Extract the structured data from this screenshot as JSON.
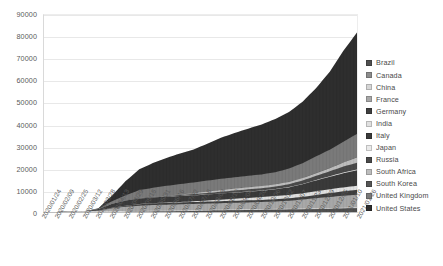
{
  "chart_data": {
    "type": "area",
    "stacked": true,
    "title": "",
    "subtitle": "",
    "xlabel": "",
    "ylabel": "",
    "ylim": [
      0,
      90000
    ],
    "y_ticks": [
      0,
      10000,
      20000,
      30000,
      40000,
      50000,
      60000,
      70000,
      80000,
      90000
    ],
    "grid": true,
    "legend_position": "right",
    "x_tick_interval_days": 16,
    "x_tick_labels": [
      "2020/01/24",
      "2020/02/09",
      "2020/02/25",
      "2020/03/12",
      "2020/03/28",
      "2020/04/13",
      "2020/04/29",
      "2020/05/15",
      "2020/05/31",
      "2020/06/16",
      "2020/07/02",
      "2020/07/18",
      "2020/08/03",
      "2020/08/19",
      "2020/09/04",
      "2020/09/20",
      "2020/10/06",
      "2020/10/22",
      "2020/11/07",
      "2020/11/23",
      "2020/12/09",
      "2020/12/25",
      "2021/01/10",
      "2021/01/26"
    ],
    "categories": [
      "2020/01/24",
      "2020/02/09",
      "2020/02/25",
      "2020/03/12",
      "2020/03/28",
      "2020/04/13",
      "2020/04/29",
      "2020/05/15",
      "2020/05/31",
      "2020/06/16",
      "2020/07/02",
      "2020/07/18",
      "2020/08/03",
      "2020/08/19",
      "2020/09/04",
      "2020/09/20",
      "2020/10/06",
      "2020/10/22",
      "2020/11/07",
      "2020/11/23",
      "2020/12/09",
      "2020/12/25",
      "2021/01/10",
      "2021/01/26"
    ],
    "series": [
      {
        "name": "Brazil",
        "color": "#4f4f4f",
        "values": [
          0,
          0,
          0,
          0,
          30,
          180,
          480,
          900,
          1500,
          2200,
          3100,
          4200,
          5300,
          6400,
          7500,
          8300,
          9000,
          9600,
          10200,
          11000,
          12000,
          13200,
          14600,
          16200
        ]
      },
      {
        "name": "Canada",
        "color": "#8c8c8c",
        "values": [
          0,
          0,
          0,
          0,
          5,
          25,
          60,
          100,
          140,
          170,
          190,
          205,
          215,
          222,
          228,
          234,
          242,
          255,
          275,
          305,
          345,
          395,
          460,
          540
        ]
      },
      {
        "name": "China",
        "color": "#d6d6d6",
        "values": [
          20,
          400,
          2500,
          3180,
          3300,
          3340,
          3350,
          3360,
          3365,
          3370,
          3375,
          3380,
          3385,
          3390,
          3395,
          3400,
          3405,
          3410,
          3415,
          3420,
          3425,
          3430,
          3435,
          3440
        ]
      },
      {
        "name": "France",
        "color": "#a8a8a8",
        "values": [
          0,
          0,
          0,
          40,
          1800,
          12000,
          18500,
          22500,
          24500,
          25500,
          26000,
          26500,
          27000,
          27500,
          28000,
          28800,
          29800,
          31500,
          34000,
          38000,
          43000,
          47000,
          50000,
          52500
        ]
      },
      {
        "name": "Germany",
        "color": "#3f3f3f",
        "values": [
          0,
          0,
          0,
          5,
          300,
          2000,
          4200,
          6300,
          7200,
          7800,
          8100,
          8200,
          8300,
          8400,
          8500,
          8600,
          8800,
          9200,
          10000,
          11500,
          13500,
          16000,
          19000,
          21500
        ]
      },
      {
        "name": "India",
        "color": "#e0e0e0",
        "values": [
          0,
          0,
          0,
          0,
          10,
          60,
          200,
          450,
          800,
          1200,
          1800,
          2800,
          4500,
          6500,
          8500,
          10500,
          12000,
          13500,
          14500,
          15200,
          15800,
          16300,
          16800,
          17300
        ]
      },
      {
        "name": "Italy",
        "color": "#3a3a3a",
        "values": [
          0,
          0,
          0,
          400,
          6800,
          17000,
          21500,
          23500,
          24000,
          24500,
          25000,
          25300,
          25500,
          25800,
          26000,
          26400,
          27000,
          28500,
          32000,
          38000,
          46000,
          53000,
          60000,
          65000
        ]
      },
      {
        "name": "Japan",
        "color": "#eaeaea",
        "values": [
          0,
          0,
          0,
          5,
          40,
          80,
          180,
          300,
          350,
          380,
          400,
          420,
          450,
          550,
          700,
          900,
          1050,
          1200,
          1350,
          1600,
          1950,
          2400,
          3200,
          4100
        ]
      },
      {
        "name": "Russia",
        "color": "#4a4a4a",
        "values": [
          0,
          0,
          0,
          0,
          5,
          60,
          300,
          900,
          1800,
          2800,
          3800,
          4800,
          6000,
          7000,
          8000,
          8800,
          9600,
          10500,
          12000,
          14500,
          17500,
          21000,
          25000,
          28500
        ]
      },
      {
        "name": "South Africa",
        "color": "#bdbdbd",
        "values": [
          0,
          0,
          0,
          0,
          2,
          25,
          75,
          200,
          550,
          1200,
          2400,
          4000,
          6000,
          7500,
          8500,
          9000,
          9400,
          9700,
          9900,
          10200,
          11000,
          13000,
          17000,
          22000
        ]
      },
      {
        "name": "South Korea",
        "color": "#555555",
        "values": [
          0,
          0,
          12,
          70,
          140,
          210,
          245,
          260,
          270,
          280,
          285,
          295,
          300,
          310,
          340,
          380,
          420,
          450,
          480,
          510,
          560,
          640,
          780,
          950
        ]
      },
      {
        "name": "United Kingdom",
        "color": "#7a7a7a",
        "values": [
          0,
          0,
          0,
          10,
          1200,
          11000,
          22000,
          34000,
          38000,
          41500,
          44000,
          45200,
          46200,
          47000,
          47500,
          48000,
          48800,
          51000,
          56000,
          63000,
          71000,
          78000,
          88000,
          99000
        ]
      },
      {
        "name": "United States",
        "color": "#2e2e2e",
        "values": [
          0,
          0,
          0,
          50,
          2500,
          24000,
          60000,
          88000,
          105000,
          118000,
          130000,
          140000,
          156000,
          174000,
          188000,
          200000,
          212000,
          226000,
          240000,
          260000,
          290000,
          330000,
          385000,
          430000
        ]
      }
    ],
    "stack_totals_display": {
      "note": "stacked band top reaches approximately 80000 at the final tick",
      "peak_value": 82000
    },
    "stack_band_tops_pct": [
      {
        "series": "United States",
        "top_pct_of_max": 100
      }
    ]
  },
  "legend": {
    "items": [
      {
        "label": "Brazil",
        "color": "#4f4f4f"
      },
      {
        "label": "Canada",
        "color": "#8c8c8c"
      },
      {
        "label": "China",
        "color": "#d6d6d6"
      },
      {
        "label": "France",
        "color": "#a8a8a8"
      },
      {
        "label": "Germany",
        "color": "#3f3f3f"
      },
      {
        "label": "India",
        "color": "#e0e0e0"
      },
      {
        "label": "Italy",
        "color": "#3a3a3a"
      },
      {
        "label": "Japan",
        "color": "#eaeaea"
      },
      {
        "label": "Russia",
        "color": "#4a4a4a"
      },
      {
        "label": "South Africa",
        "color": "#bdbdbd"
      },
      {
        "label": "South Korea",
        "color": "#555555"
      },
      {
        "label": "United Kingdom",
        "color": "#7a7a7a"
      },
      {
        "label": "United States",
        "color": "#2e2e2e"
      }
    ]
  }
}
